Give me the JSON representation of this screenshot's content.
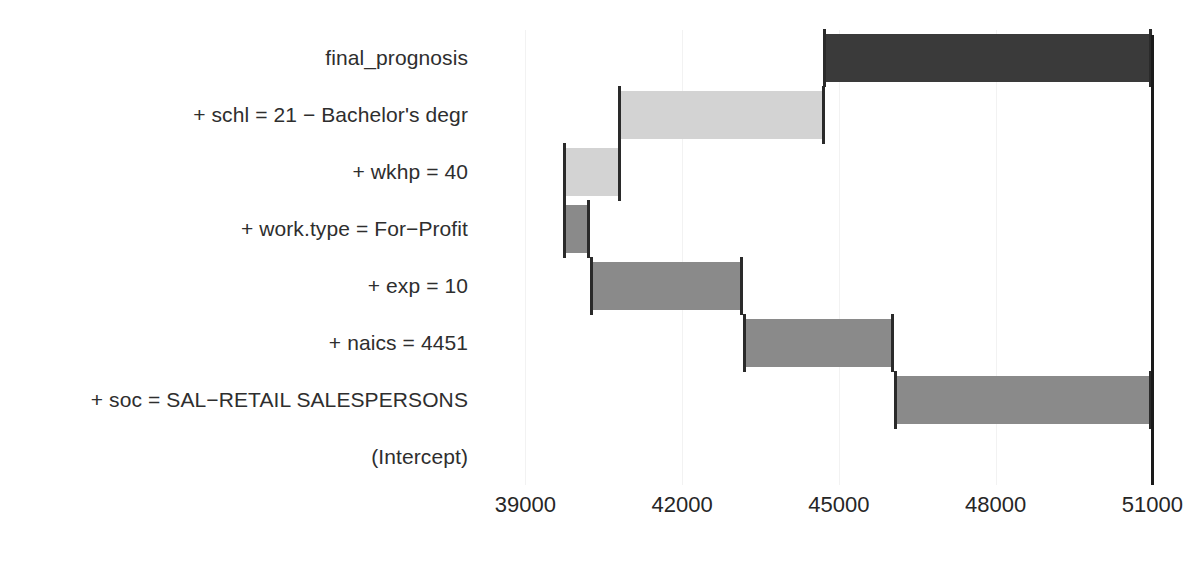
{
  "chart_data": {
    "type": "bar",
    "subtype": "waterfall-break-down",
    "title": "",
    "xlabel": "",
    "ylabel": "",
    "xlim": [
      37900,
      51300
    ],
    "grid": true,
    "legend": "none",
    "axis_ticks": [
      39000,
      42000,
      45000,
      48000,
      51000
    ],
    "axis_tick_labels": [
      "39000",
      "42000",
      "45000",
      "48000",
      "51000"
    ],
    "categories": [
      "final_prognosis",
      "+ schl = 21 − Bachelor's degr",
      "+ wkhp = 40",
      "+ work.type = For−Profit",
      "+ exp = 10",
      "+ naics = 4451",
      "+ soc = SAL−RETAIL SALESPERSONS",
      "(Intercept)"
    ],
    "bars": [
      {
        "label": "final_prognosis",
        "start": 44700,
        "end": 51000,
        "value": 6300,
        "color": "#3a3a3a",
        "kind": "total"
      },
      {
        "label": "+ schl = 21 − Bachelor's degr",
        "start": 40780,
        "end": 44730,
        "value": 3950,
        "color": "#d3d3d3",
        "kind": "positive"
      },
      {
        "label": "+ wkhp = 40",
        "start": 39710,
        "end": 40820,
        "value": 1110,
        "color": "#d3d3d3",
        "kind": "positive"
      },
      {
        "label": "+ work.type = For−Profit",
        "start": 39710,
        "end": 40230,
        "value": 520,
        "color": "#8a8a8a",
        "kind": "positive"
      },
      {
        "label": "+ exp = 10",
        "start": 40230,
        "end": 43170,
        "value": 2940,
        "color": "#8a8a8a",
        "kind": "positive"
      },
      {
        "label": "+ naics = 4451",
        "start": 43170,
        "end": 46060,
        "value": 2890,
        "color": "#8a8a8a",
        "kind": "positive"
      },
      {
        "label": "+ soc = SAL−RETAIL SALESPERSONS",
        "start": 46060,
        "end": 51000,
        "value": 4940,
        "color": "#8a8a8a",
        "kind": "positive"
      },
      {
        "label": "(Intercept)",
        "start": 46060,
        "end": 46060,
        "value": 0,
        "color": "#8a8a8a",
        "kind": "baseline"
      }
    ],
    "colors": {
      "total_bar": "#3a3a3a",
      "light_bar": "#d3d3d3",
      "medium_bar": "#8a8a8a",
      "gridline": "#f2f2f2",
      "axis_line": "#1a1a1a",
      "text": "#2e2e2e",
      "background": "#ffffff"
    }
  }
}
